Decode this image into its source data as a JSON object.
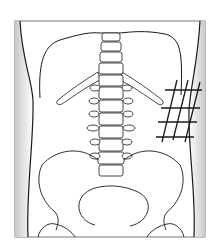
{
  "diagram": {
    "title": "Abdominal region diagram with hatched area on right flank",
    "components": [
      {
        "id": "frame",
        "label": "Body outline frame"
      },
      {
        "id": "ribcage",
        "label": "Lower rib margin"
      },
      {
        "id": "spine",
        "label": "Lumbar vertebrae"
      },
      {
        "id": "ribs-floating",
        "label": "Floating ribs"
      },
      {
        "id": "pelvis",
        "label": "Pelvis / iliac crests"
      },
      {
        "id": "hatch",
        "label": "Hatched region (right flank)"
      }
    ],
    "colors": {
      "line": "#1a1a1a",
      "side_shade": "#d0d0d0",
      "background": "#ffffff"
    }
  }
}
